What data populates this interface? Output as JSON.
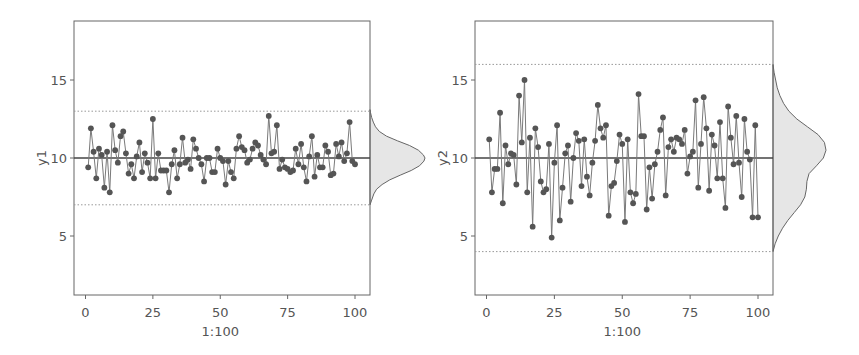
{
  "chart_data": [
    {
      "type": "line",
      "panel": "left",
      "title": "",
      "xlabel": "1:100",
      "ylabel": "y1",
      "xlim": [
        -4,
        105
      ],
      "ylim": [
        1.2,
        18.8
      ],
      "xticks": [
        0,
        25,
        50,
        75,
        100
      ],
      "xtick_labels": [
        "0",
        "25",
        "50",
        "75",
        "100"
      ],
      "yticks": [
        5,
        10,
        15
      ],
      "ytick_labels": [
        "5",
        "10",
        "15"
      ],
      "grid": false,
      "legend": null,
      "center_line": 10,
      "control_limits": {
        "upper": 13,
        "lower": 7
      },
      "marginal_density": "right",
      "series": [
        {
          "name": "y1",
          "x": [
            1,
            2,
            3,
            4,
            5,
            6,
            7,
            8,
            9,
            10,
            11,
            12,
            13,
            14,
            15,
            16,
            17,
            18,
            19,
            20,
            21,
            22,
            23,
            24,
            25,
            26,
            27,
            28,
            29,
            30,
            31,
            32,
            33,
            34,
            35,
            36,
            37,
            38,
            39,
            40,
            41,
            42,
            43,
            44,
            45,
            46,
            47,
            48,
            49,
            50,
            51,
            52,
            53,
            54,
            55,
            56,
            57,
            58,
            59,
            60,
            61,
            62,
            63,
            64,
            65,
            66,
            67,
            68,
            69,
            70,
            71,
            72,
            73,
            74,
            75,
            76,
            77,
            78,
            79,
            80,
            81,
            82,
            83,
            84,
            85,
            86,
            87,
            88,
            89,
            90,
            91,
            92,
            93,
            94,
            95,
            96,
            97,
            98,
            99,
            100
          ],
          "values": [
            9.4,
            11.9,
            10.4,
            8.7,
            10.6,
            10.2,
            8.1,
            10.4,
            7.8,
            12.1,
            10.5,
            9.7,
            11.4,
            11.7,
            10.3,
            9.0,
            9.6,
            8.7,
            10.1,
            11.0,
            9.1,
            10.3,
            9.7,
            8.7,
            12.5,
            8.7,
            10.3,
            9.2,
            9.2,
            9.2,
            7.8,
            9.6,
            10.5,
            8.7,
            9.6,
            11.3,
            9.7,
            9.9,
            9.3,
            11.2,
            10.6,
            10.0,
            9.6,
            8.5,
            10.0,
            10.0,
            9.1,
            9.1,
            10.6,
            10.0,
            9.8,
            8.3,
            9.8,
            9.1,
            8.7,
            10.6,
            11.4,
            10.7,
            10.5,
            9.7,
            9.9,
            10.6,
            11.0,
            10.8,
            10.2,
            9.9,
            9.6,
            12.7,
            10.3,
            10.4,
            12.1,
            9.3,
            9.9,
            9.4,
            9.3,
            9.1,
            9.2,
            10.6,
            9.6,
            10.9,
            9.4,
            8.5,
            10.1,
            11.4,
            8.8,
            10.2,
            9.4,
            9.4,
            10.8,
            10.4,
            8.9,
            9.0,
            10.9,
            10.1,
            11.0,
            9.8,
            10.3,
            12.3,
            9.8,
            9.6
          ]
        }
      ],
      "density": {
        "y": [
          7.0,
          7.3,
          7.7,
          8.0,
          8.3,
          8.6,
          8.9,
          9.2,
          9.5,
          9.8,
          10.0,
          10.2,
          10.5,
          10.8,
          11.1,
          11.4,
          11.7,
          12.0,
          12.3,
          12.6,
          12.9,
          13.1
        ],
        "d": [
          0.0,
          0.03,
          0.07,
          0.12,
          0.22,
          0.36,
          0.55,
          0.75,
          0.9,
          0.98,
          1.0,
          0.97,
          0.88,
          0.72,
          0.5,
          0.3,
          0.17,
          0.1,
          0.06,
          0.03,
          0.01,
          0.0
        ]
      }
    },
    {
      "type": "line",
      "panel": "right",
      "title": "",
      "xlabel": "1:100",
      "ylabel": "y2",
      "xlim": [
        -4,
        105
      ],
      "ylim": [
        1.2,
        18.8
      ],
      "xticks": [
        0,
        25,
        50,
        75,
        100
      ],
      "xtick_labels": [
        "0",
        "25",
        "50",
        "75",
        "100"
      ],
      "yticks": [
        5,
        10,
        15
      ],
      "ytick_labels": [
        "5",
        "10",
        "15"
      ],
      "grid": false,
      "legend": null,
      "center_line": 10,
      "control_limits": {
        "upper": 16,
        "lower": 4
      },
      "marginal_density": "right",
      "series": [
        {
          "name": "y2",
          "x": [
            1,
            2,
            3,
            4,
            5,
            6,
            7,
            8,
            9,
            10,
            11,
            12,
            13,
            14,
            15,
            16,
            17,
            18,
            19,
            20,
            21,
            22,
            23,
            24,
            25,
            26,
            27,
            28,
            29,
            30,
            31,
            32,
            33,
            34,
            35,
            36,
            37,
            38,
            39,
            40,
            41,
            42,
            43,
            44,
            45,
            46,
            47,
            48,
            49,
            50,
            51,
            52,
            53,
            54,
            55,
            56,
            57,
            58,
            59,
            60,
            61,
            62,
            63,
            64,
            65,
            66,
            67,
            68,
            69,
            70,
            71,
            72,
            73,
            74,
            75,
            76,
            77,
            78,
            79,
            80,
            81,
            82,
            83,
            84,
            85,
            86,
            87,
            88,
            89,
            90,
            91,
            92,
            93,
            94,
            95,
            96,
            97,
            98,
            99,
            100
          ],
          "values": [
            11.2,
            7.8,
            9.3,
            9.3,
            12.9,
            7.1,
            10.8,
            9.6,
            10.3,
            10.2,
            8.3,
            14.0,
            11.0,
            15.0,
            7.8,
            11.3,
            5.6,
            11.9,
            10.7,
            8.5,
            7.8,
            8.0,
            10.9,
            4.9,
            9.7,
            12.1,
            6.0,
            8.1,
            10.3,
            10.8,
            7.2,
            10.0,
            11.6,
            11.1,
            8.2,
            11.2,
            8.8,
            7.6,
            9.7,
            11.1,
            13.4,
            11.9,
            11.3,
            12.1,
            6.3,
            8.2,
            8.4,
            9.8,
            11.5,
            10.9,
            5.9,
            11.2,
            7.8,
            7.1,
            7.7,
            14.1,
            11.4,
            11.4,
            6.7,
            9.4,
            7.4,
            9.6,
            10.4,
            11.8,
            12.6,
            7.6,
            10.7,
            11.2,
            10.4,
            11.3,
            11.2,
            10.9,
            11.8,
            9.0,
            10.1,
            10.4,
            13.7,
            8.1,
            10.9,
            13.9,
            11.9,
            7.9,
            11.5,
            10.8,
            8.7,
            12.3,
            8.7,
            6.8,
            13.3,
            11.3,
            9.6,
            12.7,
            9.7,
            7.5,
            12.5,
            10.4,
            9.9,
            6.2,
            12.1,
            6.2
          ]
        }
      ],
      "density": {
        "y": [
          4.0,
          4.5,
          5.0,
          5.5,
          6.0,
          6.5,
          7.0,
          7.5,
          8.0,
          8.5,
          9.0,
          9.5,
          10.0,
          10.5,
          11.0,
          11.5,
          12.0,
          12.5,
          13.0,
          13.5,
          14.0,
          14.5,
          15.0,
          15.5,
          16.0
        ],
        "d": [
          0.0,
          0.04,
          0.1,
          0.18,
          0.28,
          0.4,
          0.52,
          0.6,
          0.63,
          0.64,
          0.68,
          0.82,
          0.95,
          1.0,
          0.97,
          0.85,
          0.65,
          0.45,
          0.3,
          0.2,
          0.13,
          0.08,
          0.05,
          0.02,
          0.0
        ]
      }
    }
  ],
  "style": {
    "point_color": "#555555",
    "line_color": "#7a7a7a",
    "center_line_color": "#444444",
    "limit_line_color": "#999999",
    "density_fill": "#e6e6e6",
    "density_stroke": "#666666",
    "frame_color": "#666666"
  }
}
